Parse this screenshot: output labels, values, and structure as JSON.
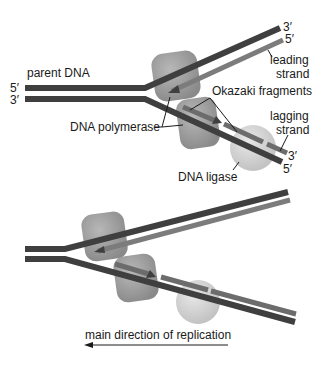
{
  "diagram": {
    "labels": {
      "parent_dna": "parent DNA",
      "five_prime_left": "5′",
      "three_prime_left": "3′",
      "three_prime_top_right": "3′",
      "five_prime_top_right": "5′",
      "leading_strand_line1": "leading",
      "leading_strand_line2": "strand",
      "okazaki_fragments": "Okazaki fragments",
      "lagging_strand_line1": "lagging",
      "lagging_strand_line2": "strand",
      "three_prime_bottom_right": "3′",
      "five_prime_bottom_right": "5′",
      "dna_polymerase": "DNA polymerase",
      "dna_ligase": "DNA ligase",
      "direction": "main direction of replication"
    },
    "colors": {
      "parent_strand": "#3f3f3f",
      "new_strand": "#7c7c7c",
      "polymerase": "#8e8e8e",
      "ligase": "#cfcfcf",
      "text": "#1a1a1a"
    }
  }
}
